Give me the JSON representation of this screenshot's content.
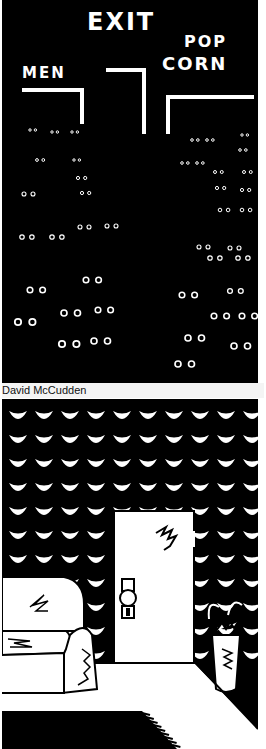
{
  "illustration": {
    "credit": "David McCudden",
    "top_panel": {
      "description": "dark movie theater with glowing eyes",
      "signs": {
        "exit": "EXIT",
        "men": "MEN",
        "popcorn_line1": "POP",
        "popcorn_line2": "CORN"
      },
      "colors": {
        "background": "#000000",
        "foreground": "#ffffff"
      }
    },
    "bottom_panel": {
      "description": "room with eye-patterned wallpaper, door, armchair, umbrella stand and rug",
      "colors": {
        "wallpaper": "#000000",
        "pattern": "#ffffff",
        "floor": "#ffffff"
      }
    }
  }
}
